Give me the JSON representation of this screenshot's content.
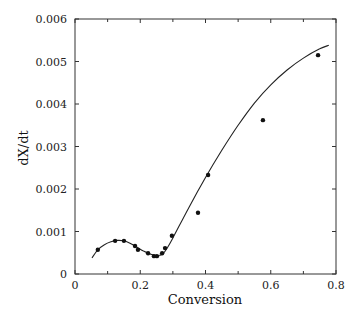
{
  "chart_data": {
    "type": "scatter",
    "title": "",
    "xlabel": "Conversion",
    "ylabel": "dX/dt",
    "xlim": [
      0,
      0.8
    ],
    "ylim": [
      0,
      0.006
    ],
    "x_ticks": [
      0,
      0.2,
      0.4,
      0.6,
      0.8
    ],
    "x_tick_labels": [
      "0",
      "0.2",
      "0.4",
      "0.6",
      "0.8"
    ],
    "x_minor_ticks": [
      0.1,
      0.3,
      0.5,
      0.7
    ],
    "y_ticks": [
      0,
      0.001,
      0.002,
      0.003,
      0.004,
      0.005,
      0.006
    ],
    "y_tick_labels": [
      "0",
      "0.001",
      "0.002",
      "0.003",
      "0.004",
      "0.005",
      "0.006"
    ],
    "grid": false,
    "legend": null,
    "series": [
      {
        "name": "Experimental data",
        "type": "scatter",
        "marker": "filled-circle",
        "x": [
          0.07,
          0.123,
          0.15,
          0.184,
          0.193,
          0.224,
          0.242,
          0.251,
          0.267,
          0.276,
          0.297,
          0.377,
          0.408,
          0.576,
          0.745
        ],
        "y": [
          0.00057,
          0.00078,
          0.00078,
          0.00066,
          0.00057,
          0.00049,
          0.00042,
          0.00042,
          0.00049,
          0.00061,
          0.0009,
          0.00144,
          0.00233,
          0.00362,
          0.00515
        ]
      },
      {
        "name": "Model fit",
        "type": "line",
        "x": [
          0.052,
          0.07,
          0.09,
          0.11,
          0.13,
          0.15,
          0.17,
          0.19,
          0.21,
          0.23,
          0.25,
          0.26,
          0.27,
          0.28,
          0.3,
          0.35,
          0.4,
          0.45,
          0.5,
          0.55,
          0.6,
          0.65,
          0.7,
          0.75,
          0.778
        ],
        "y": [
          0.00038,
          0.00057,
          0.00069,
          0.00076,
          0.00079,
          0.00078,
          0.00072,
          0.00063,
          0.00054,
          0.00047,
          0.00043,
          0.00044,
          0.00048,
          0.00058,
          0.00085,
          0.00158,
          0.00227,
          0.00291,
          0.0035,
          0.00402,
          0.00445,
          0.0048,
          0.00508,
          0.0053,
          0.00538
        ]
      }
    ]
  },
  "colors": {
    "axis": "#333333",
    "line": "#222222",
    "marker": "#111111",
    "background": "#ffffff"
  }
}
